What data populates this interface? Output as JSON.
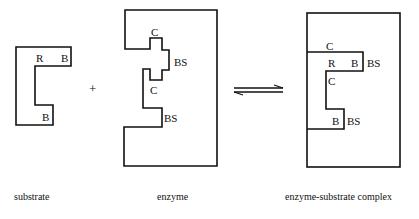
{
  "substrate": {
    "labels": {
      "r": "R",
      "b_top": "B",
      "b_bottom": "B"
    },
    "caption": "substrate"
  },
  "operator": "+",
  "enzyme": {
    "labels": {
      "c_top": "C",
      "bs_top": "BS",
      "c_mid": "C",
      "bs_bottom": "BS"
    },
    "caption": "enzyme"
  },
  "equilibrium": "⇌",
  "complex": {
    "labels": {
      "c_top": "C",
      "r": "R",
      "b_top": "B",
      "bs_top": "BS",
      "c_mid": "C",
      "b_bottom": "B",
      "bs_bottom": "BS"
    },
    "caption": "enzyme-substrate complex"
  }
}
